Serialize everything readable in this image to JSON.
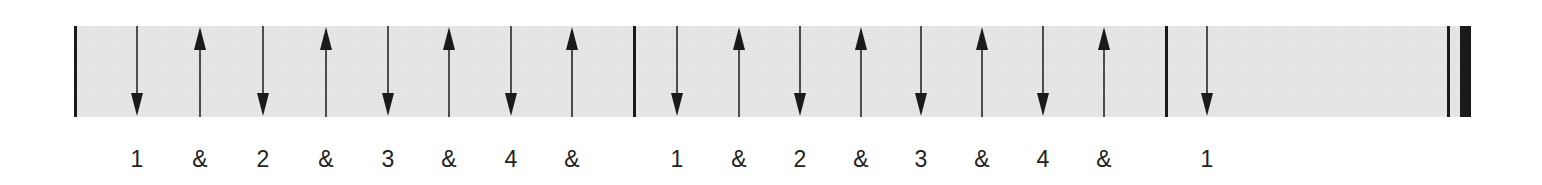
{
  "diagram": {
    "band_color": "#e6e6e6",
    "ink_color": "#1a1a1a",
    "measures": [
      {
        "index": 1,
        "strokes": [
          {
            "x": 137,
            "dir": "down",
            "count": "1"
          },
          {
            "x": 200,
            "dir": "up",
            "count": "&"
          },
          {
            "x": 263,
            "dir": "down",
            "count": "2"
          },
          {
            "x": 326,
            "dir": "up",
            "count": "&"
          },
          {
            "x": 388,
            "dir": "down",
            "count": "3"
          },
          {
            "x": 449,
            "dir": "up",
            "count": "&"
          },
          {
            "x": 511,
            "dir": "down",
            "count": "4"
          },
          {
            "x": 572,
            "dir": "up",
            "count": "&"
          }
        ]
      },
      {
        "index": 2,
        "strokes": [
          {
            "x": 677,
            "dir": "down",
            "count": "1"
          },
          {
            "x": 739,
            "dir": "up",
            "count": "&"
          },
          {
            "x": 800,
            "dir": "down",
            "count": "2"
          },
          {
            "x": 861,
            "dir": "up",
            "count": "&"
          },
          {
            "x": 921,
            "dir": "down",
            "count": "3"
          },
          {
            "x": 982,
            "dir": "up",
            "count": "&"
          },
          {
            "x": 1043,
            "dir": "down",
            "count": "4"
          },
          {
            "x": 1104,
            "dir": "up",
            "count": "&"
          }
        ]
      },
      {
        "index": 3,
        "strokes": [
          {
            "x": 1207,
            "dir": "down",
            "count": "1"
          }
        ]
      }
    ],
    "barlines": [
      {
        "x": 74,
        "width": 3,
        "type": "single"
      },
      {
        "x": 633,
        "width": 3,
        "type": "single"
      },
      {
        "x": 1165,
        "width": 3,
        "type": "single"
      },
      {
        "x": 1447,
        "width": 3,
        "type": "final-thin"
      },
      {
        "x": 1460,
        "width": 11,
        "type": "final-thick"
      }
    ]
  }
}
